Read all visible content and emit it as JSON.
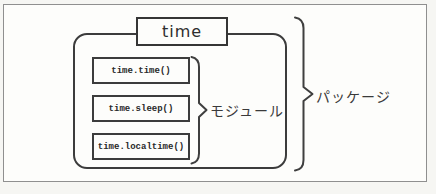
{
  "diagram": {
    "package_name": "time",
    "module_items": [
      {
        "label": "time.time()"
      },
      {
        "label": "time.sleep()"
      },
      {
        "label": "time.localtime()"
      }
    ],
    "module_brace_label": "モジュール",
    "package_brace_label": "パッケージ",
    "colors": {
      "line": "#3f3f3f",
      "frame_border": "#8f8f8f",
      "background": "#fdfdfb"
    }
  }
}
